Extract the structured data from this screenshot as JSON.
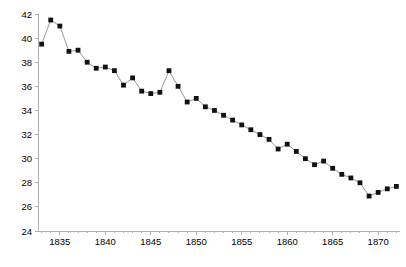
{
  "chart_data": {
    "type": "line",
    "title": "",
    "subtitle": "",
    "xlabel": "",
    "ylabel": "",
    "xlim": [
      1832.6,
      1872.4
    ],
    "ylim": [
      24,
      42
    ],
    "grid": false,
    "legend": null,
    "legend_position": "none",
    "marker": "square",
    "marker_color": "#111111",
    "line_color": "#808080",
    "axis_color": "#b0b0b0",
    "y_ticks": [
      24,
      26,
      28,
      30,
      32,
      34,
      36,
      38,
      40,
      42
    ],
    "y_tick_labels": [
      "24",
      "26",
      "28",
      "30",
      "32",
      "34",
      "36",
      "38",
      "40",
      "42"
    ],
    "x_ticks": [
      1835,
      1840,
      1845,
      1850,
      1855,
      1860,
      1865,
      1870
    ],
    "x_tick_labels": [
      "1835",
      "1840",
      "1845",
      "1850",
      "1855",
      "1860",
      "1865",
      "1870"
    ],
    "x_minor_tick_step": 1,
    "x": [
      1833,
      1834,
      1835,
      1836,
      1837,
      1838,
      1839,
      1840,
      1841,
      1842,
      1843,
      1844,
      1845,
      1846,
      1847,
      1848,
      1849,
      1850,
      1851,
      1852,
      1853,
      1854,
      1855,
      1856,
      1857,
      1858,
      1859,
      1860,
      1861,
      1862,
      1863,
      1864,
      1865,
      1866,
      1867,
      1868,
      1869,
      1870,
      1871,
      1872
    ],
    "values": [
      39.5,
      41.5,
      41.0,
      38.9,
      39.0,
      38.0,
      37.5,
      37.6,
      37.3,
      36.1,
      36.7,
      35.6,
      35.4,
      35.5,
      37.3,
      36.0,
      34.7,
      35.0,
      34.3,
      34.0,
      33.6,
      33.2,
      32.8,
      32.4,
      32.0,
      31.6,
      30.8,
      31.2,
      30.6,
      30.0,
      29.5,
      29.8,
      29.2,
      28.7,
      28.4,
      28.0,
      26.9,
      27.2,
      27.5,
      27.7
    ],
    "series": [
      {
        "name": "series-1",
        "values": [
          39.5,
          41.5,
          41.0,
          38.9,
          39.0,
          38.0,
          37.5,
          37.6,
          37.3,
          36.1,
          36.7,
          35.6,
          35.4,
          35.5,
          37.3,
          36.0,
          34.7,
          35.0,
          34.3,
          34.0,
          33.6,
          33.2,
          32.8,
          32.4,
          32.0,
          31.6,
          30.8,
          31.2,
          30.6,
          30.0,
          29.5,
          29.8,
          29.2,
          28.7,
          28.4,
          28.0,
          26.9,
          27.2,
          27.5,
          27.7
        ]
      }
    ]
  },
  "layout": {
    "plot_left": 38,
    "plot_right": 400,
    "plot_top": 14,
    "plot_bottom": 231
  }
}
